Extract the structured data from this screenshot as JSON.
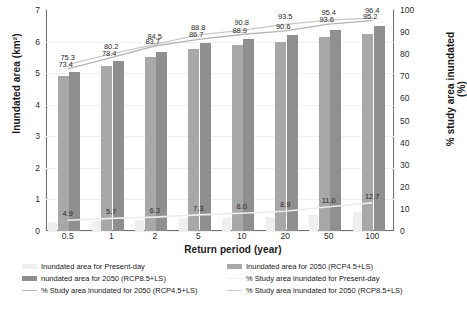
{
  "chart_data": {
    "type": "bar",
    "title": "",
    "xlabel": "Return period (year)",
    "ylabel": "Inundated area (km²)",
    "ylabel_right": "% study area inundated (%)",
    "categories": [
      "0.5",
      "1",
      "2",
      "5",
      "10",
      "20",
      "50",
      "100"
    ],
    "ylim": [
      0,
      7
    ],
    "ylim_right": [
      0,
      100
    ],
    "yticks": [
      "7",
      "6",
      "5",
      "4",
      "3",
      "2",
      "1",
      "0"
    ],
    "yticks_right": [
      "100",
      "90",
      "80",
      "70",
      "60",
      "50",
      "40",
      "30",
      "20",
      "10",
      "0"
    ],
    "grid": true,
    "legend_position": "bottom",
    "series": [
      {
        "name": "Inundated area for Present-day",
        "kind": "bar",
        "color": "#efefef",
        "axis": "left",
        "values": [
          0.3,
          0.33,
          0.36,
          0.4,
          0.42,
          0.45,
          0.52,
          0.6
        ]
      },
      {
        "name": "Inundated area for 2050 (RCP4.5+LS)",
        "kind": "bar",
        "color": "#a8a8a8",
        "axis": "left",
        "values": [
          4.9,
          5.22,
          5.5,
          5.75,
          5.88,
          6.0,
          6.15,
          6.25
        ]
      },
      {
        "name": "Inundated area for 2050 (RCP8.5+LS)",
        "kind": "bar",
        "color": "#8f8f8f",
        "axis": "left",
        "values": [
          5.05,
          5.4,
          5.68,
          5.95,
          6.08,
          6.22,
          6.38,
          6.5
        ]
      },
      {
        "name": "% Study area inundated for Present-day",
        "kind": "line",
        "color": "#ededed",
        "axis": "right",
        "values": [
          4.9,
          5.7,
          6.3,
          7.3,
          8.0,
          8.9,
          11.0,
          12.7
        ],
        "labels": [
          "4.9",
          "5.7",
          "6.3",
          "7.3",
          "8.0",
          "8.9",
          "11.0",
          "12.7"
        ]
      },
      {
        "name": "% Study area inundated for 2050 (RCP4.5+LS)",
        "kind": "line",
        "color": "#b5b5b5",
        "axis": "right",
        "values": [
          73.4,
          78.4,
          83.7,
          86.7,
          88.9,
          90.6,
          93.6,
          95.2
        ],
        "labels": [
          "73.4",
          "78.4",
          "83.7",
          "86.7",
          "88.9",
          "90.6",
          "93.6",
          "95.2"
        ]
      },
      {
        "name": "% Study area inundated for 2050 (RCP8.5+LS)",
        "kind": "line",
        "color": "#c9c9c9",
        "axis": "right",
        "values": [
          75.3,
          80.2,
          84.5,
          88.8,
          90.8,
          93.5,
          95.4,
          96.4
        ],
        "labels": [
          "75.3",
          "80.2",
          "84.5",
          "88.8",
          "90.8",
          "93.5",
          "95.4",
          "96.4"
        ]
      }
    ]
  },
  "legend": {
    "items": [
      {
        "label": "Inundated area for Present-day",
        "swatch": "bar",
        "color": "#efefef"
      },
      {
        "label": "Inundated area for 2050 (RCP4.5+LS)",
        "swatch": "bar",
        "color": "#a8a8a8"
      },
      {
        "label": "nundated area for 2050 (RCP8.5+LS)",
        "swatch": "bar",
        "color": "#8f8f8f"
      },
      {
        "label": "% Study area inundated for Present-day",
        "swatch": "line",
        "color": "#ededed"
      },
      {
        "label": "% Study area inundated for 2050 (RCP4.5+LS)",
        "swatch": "line",
        "color": "#b5b5b5"
      },
      {
        "label": "% Study area inundated for 2050 (RCP8.5+LS)",
        "swatch": "line",
        "color": "#c9c9c9"
      }
    ]
  }
}
